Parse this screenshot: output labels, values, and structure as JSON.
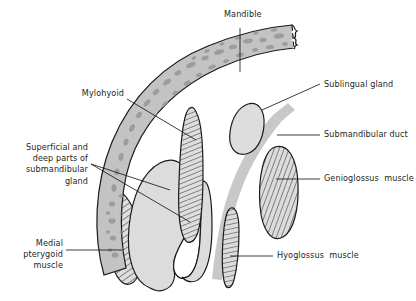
{
  "figure": {
    "background_color": "#ffffff",
    "text_color": "#231f20",
    "line_color": "#1a1a1a"
  },
  "labels": [
    {
      "id": "mandible",
      "name": "Mandible",
      "text": "Mandible",
      "align": "left",
      "x": 224,
      "y": 15,
      "leader": "vertical-down"
    },
    {
      "id": "mylohyoid",
      "name": "Mylohyoid",
      "text": "Mylohyoid",
      "align": "right",
      "x": 74,
      "y": 93,
      "leader": "right-down"
    },
    {
      "id": "sublingual-gland",
      "name": "Sublingual gland",
      "text": "Sublingual gland",
      "align": "left",
      "x": 324,
      "y": 78,
      "leader": "left-down"
    },
    {
      "id": "submandibular-duct",
      "name": "Submandibular duct",
      "text": "Submandibular duct",
      "align": "left",
      "x": 324,
      "y": 130,
      "leader": "left"
    },
    {
      "id": "genioglossus-muscle",
      "name": "Genioglossus muscle",
      "text": "Genioglossus  muscle",
      "align": "left",
      "x": 324,
      "y": 174,
      "leader": "left"
    },
    {
      "id": "hyoglossus-muscle",
      "name": "Hyoglossus muscle",
      "text": "Hyoglossus  muscle",
      "align": "left",
      "x": 277,
      "y": 251,
      "leader": "left"
    },
    {
      "id": "submandibular-gland",
      "name": "Superficial and deep parts of submandibular gland",
      "text": "Superficial and\ndeep parts of\nsubmandibular\ngland",
      "align": "right",
      "x": 8,
      "y": 142,
      "leader": "right-fan"
    },
    {
      "id": "medial-pterygoid",
      "name": "Medial pterygoid muscle",
      "text": "Medial\npterygoid\nmuscle",
      "align": "right",
      "x": 8,
      "y": 238,
      "leader": "right"
    }
  ],
  "structures": [
    {
      "id": "mandible-bone",
      "name": "mandible-bone",
      "fill": "#c3c3c3",
      "speckle": "#9a9a9a",
      "stroke": "#1a1a1a",
      "pattern": "trabecular-speckle"
    },
    {
      "id": "medial-pterygoid-muscle",
      "name": "medial-pterygoid-muscle",
      "fill": "#d7d7d7",
      "stroke": "#1a1a1a",
      "pattern": "diagonal-hatch"
    },
    {
      "id": "mylohyoid-muscle",
      "name": "mylohyoid-muscle",
      "fill": "#d2d2d2",
      "stroke": "#1a1a1a",
      "pattern": "diagonal-hatch"
    },
    {
      "id": "submandibular-gland-body",
      "name": "submandibular-gland-body",
      "fill": "#dcdcdc",
      "stroke": "#1a1a1a",
      "pattern": "solid"
    },
    {
      "id": "sublingual-gland-body",
      "name": "sublingual-gland-body",
      "fill": "#dddddd",
      "stroke": "#1a1a1a",
      "pattern": "solid"
    },
    {
      "id": "submandibular-duct-band",
      "name": "submandibular-duct-band",
      "fill": "#c8c8c8",
      "stroke": "none",
      "pattern": "solid"
    },
    {
      "id": "genioglossus-muscle-body",
      "name": "genioglossus-muscle-body",
      "fill": "#d2d2d2",
      "stroke": "#1a1a1a",
      "pattern": "diagonal-hatch"
    },
    {
      "id": "hyoglossus-muscle-body",
      "name": "hyoglossus-muscle-body",
      "fill": "#d2d2d2",
      "stroke": "#1a1a1a",
      "pattern": "diagonal-hatch"
    }
  ]
}
